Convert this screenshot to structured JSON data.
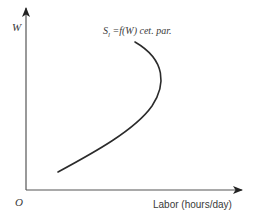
{
  "diagram": {
    "type": "labor-supply-curve",
    "y_axis": {
      "label": "W"
    },
    "x_axis": {
      "label": "Labor (hours/day)"
    },
    "origin": {
      "label": "O"
    },
    "curve": {
      "label_main": "S",
      "label_sub": "l",
      "label_rest": " =f(W) cet. par.",
      "shape": "backward-bending",
      "color": "#2b2b2b"
    },
    "colors": {
      "axis": "#555555",
      "text": "#3a3a3a",
      "background": "#ffffff"
    }
  }
}
